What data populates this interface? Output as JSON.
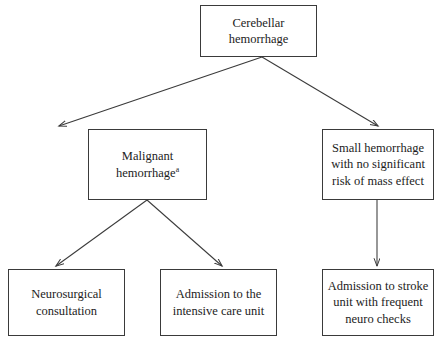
{
  "diagram": {
    "type": "flowchart",
    "background_color": "#ffffff",
    "line_color": "#3a3a3a",
    "text_color": "#1c1c1c",
    "nodes": {
      "root": {
        "label": "Cerebellar hemorrhage",
        "lines": [
          "Cerebellar",
          "hemorrhage"
        ]
      },
      "malignant": {
        "label": "Malignant hemorrhage",
        "lines": [
          "Malignant",
          "hemorrhage"
        ],
        "footnote_marker": "a"
      },
      "small": {
        "label": "Small hemorrhage with no significant risk of mass effect",
        "lines": [
          "Small hemorrhage",
          "with no significant",
          "risk of mass effect"
        ]
      },
      "neurosurgical": {
        "label": "Neurosurgical consultation",
        "lines": [
          "Neurosurgical",
          "consultation"
        ]
      },
      "icu": {
        "label": "Admission to the intensive care unit",
        "lines": [
          "Admission to the",
          "intensive care unit"
        ]
      },
      "stroke_unit": {
        "label": "Admission to stroke unit with frequent neuro checks",
        "lines": [
          "Admission to stroke",
          "unit with frequent",
          "neuro checks"
        ]
      }
    },
    "edges": [
      {
        "id": "root-to-malignant",
        "from": "root",
        "to": "malignant",
        "style": "diagonal-arrow"
      },
      {
        "id": "root-to-small",
        "from": "root",
        "to": "small",
        "style": "diagonal-arrow"
      },
      {
        "id": "malignant-to-neurosurgical",
        "from": "malignant",
        "to": "neurosurgical",
        "style": "diagonal-arrow"
      },
      {
        "id": "malignant-to-icu",
        "from": "malignant",
        "to": "icu",
        "style": "diagonal-arrow"
      },
      {
        "id": "small-to-stroke-unit",
        "from": "small",
        "to": "stroke_unit",
        "style": "vertical-arrow"
      }
    ]
  }
}
